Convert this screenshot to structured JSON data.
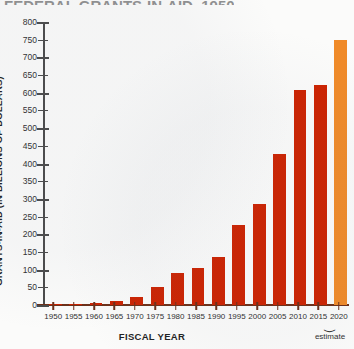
{
  "chart_data": {
    "type": "bar",
    "title": "FEDERAL GRANTS-IN-AID, 1950-2020",
    "xlabel": "FISCAL YEAR",
    "ylabel": "GRANTS-IN-AID (IN BILLIONS OF DOLLARS)",
    "categories": [
      "1950",
      "1955",
      "1960",
      "1965",
      "1970",
      "1975",
      "1980",
      "1985",
      "1990",
      "1995",
      "2000",
      "2005",
      "2010",
      "2015",
      "2020"
    ],
    "values": [
      2,
      3,
      7,
      11,
      24,
      50,
      91,
      106,
      135,
      225,
      285,
      426,
      607,
      622,
      750
    ],
    "ylim": [
      0,
      800
    ],
    "yticks": [
      0,
      50,
      100,
      150,
      200,
      250,
      300,
      350,
      400,
      450,
      500,
      550,
      600,
      650,
      700,
      750,
      800
    ],
    "ytick_labels": [
      "0",
      "50",
      "100",
      "150",
      "200",
      "250",
      "300",
      "350",
      "400",
      "450",
      "500",
      "550",
      "600",
      "650",
      "700",
      "750",
      "800"
    ],
    "grid": false,
    "legend": "none",
    "bar_color": "#cc2200",
    "estimate_color": "#f08a28",
    "annotations": [
      {
        "text": "estimate",
        "applies_to": "2020",
        "brace": true
      }
    ]
  },
  "notes": {
    "estimate_label": "estimate",
    "brace_glyph": "⏝"
  }
}
